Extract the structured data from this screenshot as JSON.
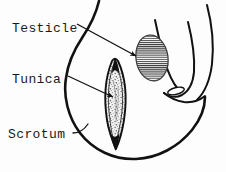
{
  "figure": {
    "background_color": "#fdfdfd",
    "ink_color": "#111111",
    "hatch_color": "#333333",
    "stipple_color": "#5a5a5a"
  },
  "labels": {
    "testicle": "Testicle",
    "tunica": "Tunica",
    "scrotum": "Scrotum"
  },
  "structures": {
    "scrotum_sac": "scrotal-sac-outline",
    "testicle_oval": "hatched-testicle-oval",
    "tunica_lens": "tunica-vaginalis-lens",
    "penis_shaft": "penis-shaft-outline",
    "urethral_meatus": "urethral-meatus-oval"
  },
  "leader_lines": {
    "testicle_pointer": "arrow-to-testicle",
    "tunica_pointer": "arrow-to-tunica",
    "scrotum_pointer": "line-to-scrotum"
  }
}
